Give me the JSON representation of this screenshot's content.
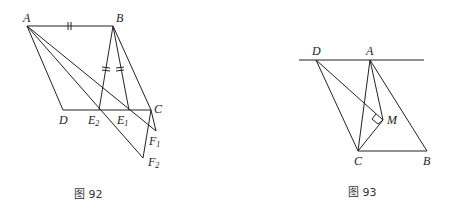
{
  "figures": [
    {
      "id": "fig92",
      "caption": "图 92",
      "points": {
        "A": {
          "label": "A",
          "x": 27,
          "y": 26
        },
        "B": {
          "label": "B",
          "x": 113,
          "y": 26
        },
        "C": {
          "label": "C",
          "x": 151,
          "y": 110
        },
        "D": {
          "label": "D",
          "x": 63,
          "y": 110
        },
        "E1": {
          "label": "E",
          "sub": "1",
          "x": 129,
          "y": 110
        },
        "E2": {
          "label": "E",
          "sub": "2",
          "x": 99,
          "y": 110
        },
        "F1": {
          "label": "F",
          "sub": "1",
          "x": 156,
          "y": 131
        },
        "F2": {
          "label": "F",
          "sub": "2",
          "x": 143,
          "y": 158
        }
      },
      "segments": [
        "A-B",
        "B-C",
        "A-D",
        "D-C",
        "A-F1",
        "A-F2",
        "B-E1",
        "B-E2",
        "C-F1",
        "C-F2"
      ],
      "tick_marks": [
        "A-B",
        "B-E1",
        "B-E2"
      ]
    },
    {
      "id": "fig93",
      "caption": "图 93",
      "points": {
        "A": {
          "label": "A",
          "x": 370,
          "y": 60
        },
        "B": {
          "label": "B",
          "x": 427,
          "y": 151
        },
        "C": {
          "label": "C",
          "x": 358,
          "y": 151
        },
        "D": {
          "label": "D",
          "x": 316,
          "y": 60
        },
        "M": {
          "label": "M",
          "x": 383,
          "y": 120
        }
      },
      "line": {
        "x1": 299,
        "y1": 60,
        "x2": 424,
        "y2": 60
      },
      "segments": [
        "D-C",
        "D-M",
        "A-C",
        "A-M",
        "A-B",
        "C-M",
        "C-B"
      ],
      "right_angle_at": "M"
    }
  ]
}
